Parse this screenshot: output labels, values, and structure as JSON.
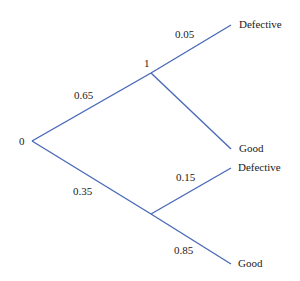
{
  "diagram": {
    "type": "probability-tree",
    "colors": {
      "edge": "#4a6ab8",
      "text": "#1a1a1a",
      "background": "#ffffff"
    },
    "nodes": {
      "root": {
        "label": "0"
      },
      "upper": {
        "label": "1"
      },
      "lower": {
        "label": ""
      }
    },
    "edges": [
      {
        "from": "root",
        "to": "upper",
        "probability": "0.65"
      },
      {
        "from": "root",
        "to": "lower",
        "probability": "0.35"
      },
      {
        "from": "upper",
        "to": "upper_defective",
        "probability": "0.05"
      },
      {
        "from": "upper",
        "to": "upper_good",
        "probability": ""
      },
      {
        "from": "lower",
        "to": "lower_defective",
        "probability": "0.15"
      },
      {
        "from": "lower",
        "to": "lower_good",
        "probability": "0.85"
      }
    ],
    "leaves": {
      "upper_defective": "Defective",
      "upper_good": "Good",
      "lower_defective": "Defective",
      "lower_good": "Good"
    }
  }
}
